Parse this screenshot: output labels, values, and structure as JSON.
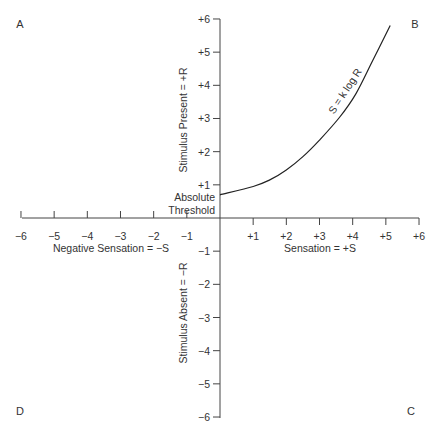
{
  "chart_data": {
    "type": "line",
    "title": "",
    "xlabel_positive": "Sensation = +S",
    "xlabel_negative": "Negative Sensation = −S",
    "ylabel_positive": "Stimulus Present = +R",
    "ylabel_negative": "Stimulus Absent = −R",
    "xlim": [
      -6,
      6
    ],
    "ylim": [
      -6,
      6
    ],
    "x_ticks": [
      "−6",
      "−5",
      "−4",
      "−3",
      "−2",
      "−1",
      "+1",
      "+2",
      "+3",
      "+4",
      "+5",
      "+6"
    ],
    "x_tick_values": [
      -6,
      -5,
      -4,
      -3,
      -2,
      -1,
      1,
      2,
      3,
      4,
      5,
      6
    ],
    "y_ticks": [
      "+6",
      "+5",
      "+4",
      "+3",
      "+2",
      "+1",
      "−1",
      "−2",
      "−3",
      "−4",
      "−5",
      "−6"
    ],
    "y_tick_values": [
      6,
      5,
      4,
      3,
      2,
      1,
      -1,
      -2,
      -3,
      -4,
      -5,
      -6
    ],
    "grid": false,
    "quadrant_labels": {
      "top_left": "A",
      "top_right": "B",
      "bottom_right": "C",
      "bottom_left": "D"
    },
    "annotations": [
      {
        "text": "Absolute",
        "note": "threshold label line 1"
      },
      {
        "text": "Threshold",
        "note": "threshold label line 2"
      },
      {
        "text": "S = k log R",
        "note": "curve label"
      }
    ],
    "series": [
      {
        "name": "S = k log R",
        "x": [
          0,
          1.0,
          1.5,
          2.0,
          2.5,
          3.0,
          3.6,
          4.1,
          4.6,
          5.13
        ],
        "y": [
          0.7,
          0.95,
          1.15,
          1.45,
          1.85,
          2.35,
          3.03,
          3.75,
          4.74,
          5.8
        ]
      }
    ]
  },
  "labels": {
    "quadrant_a": "A",
    "quadrant_b": "B",
    "quadrant_c": "C",
    "quadrant_d": "D",
    "threshold_line1": "Absolute",
    "threshold_line2": "Threshold",
    "curve_label": "S = k log R",
    "x_pos_label": "Sensation = +S",
    "x_neg_label": "Negative Sensation = −S",
    "y_pos_label": "Stimulus Present = +R",
    "y_neg_label": "Stimulus Absent = −R"
  }
}
